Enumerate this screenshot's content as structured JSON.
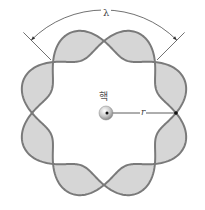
{
  "diagram": {
    "labels": {
      "wavelength": "λ",
      "nucleus": "핵",
      "radius": "r"
    },
    "geometry": {
      "center": [
        104,
        113
      ],
      "orbit_radius": 72,
      "amplitude": 15,
      "wavelengths_around_orbit": 4,
      "nodes": 8
    },
    "colors": {
      "wave_stroke": "#7a7a7a",
      "wave_fill": "#d6d6d6",
      "annotation": "#333333",
      "nucleus": "#bdbdbd"
    }
  }
}
